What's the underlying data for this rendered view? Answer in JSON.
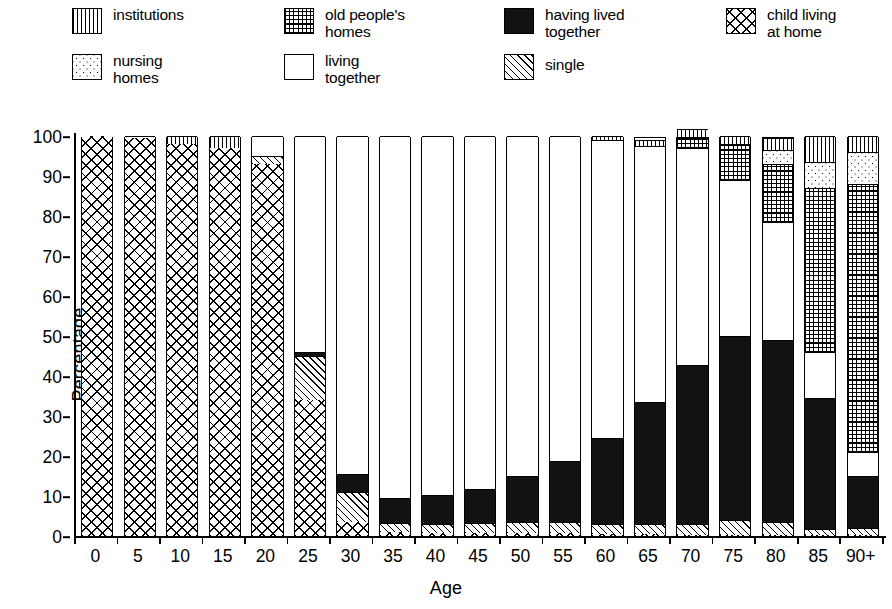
{
  "legend": {
    "items": [
      {
        "label": "institutions",
        "pattern": "institutions"
      },
      {
        "label": "old people's\nhomes",
        "pattern": "oldpeople"
      },
      {
        "label": "having lived\ntogether",
        "pattern": "havinglived"
      },
      {
        "label": "child living\nat home",
        "pattern": "childhome"
      },
      {
        "label": "nursing\nhomes",
        "pattern": "nursing"
      },
      {
        "label": "living\ntogether",
        "pattern": "livingtogether"
      },
      {
        "label": "single",
        "pattern": "single"
      }
    ]
  },
  "chart_data": {
    "type": "bar",
    "subtype": "stacked-bar-100",
    "title": "",
    "xlabel": "Age",
    "ylabel": "Percentage",
    "ylim": [
      0,
      100
    ],
    "ytick_labels": [
      "0",
      "10",
      "20",
      "30",
      "40",
      "50",
      "60",
      "70",
      "80",
      "90",
      "100"
    ],
    "ytick_values": [
      0,
      10,
      20,
      30,
      40,
      50,
      60,
      70,
      80,
      90,
      100
    ],
    "grid": false,
    "legend_position": "top",
    "categories": [
      "0",
      "5",
      "10",
      "15",
      "20",
      "25",
      "30",
      "35",
      "40",
      "45",
      "50",
      "55",
      "60",
      "65",
      "70",
      "75",
      "80",
      "85",
      "90+"
    ],
    "series": [
      {
        "name": "child living at home",
        "key": "childhome",
        "values": [
          100,
          99.5,
          98,
          97,
          93,
          34,
          3.5,
          1,
          0.8,
          0.8,
          0.8,
          0.8,
          0.5,
          0.5,
          0.3,
          0.3,
          0.3,
          0.2,
          0.2
        ]
      },
      {
        "name": "single",
        "key": "single",
        "values": [
          0,
          0,
          0,
          0,
          2,
          11,
          7.5,
          2.2,
          2.2,
          2.4,
          2.6,
          2.8,
          2.6,
          2.6,
          2.8,
          3.8,
          3.2,
          1.6,
          1.8
        ]
      },
      {
        "name": "having lived together",
        "key": "havinglived",
        "values": [
          0,
          0,
          0,
          0,
          0,
          1,
          4.5,
          6.3,
          7.3,
          8.5,
          11.6,
          15.2,
          21.4,
          30.4,
          39.7,
          45.9,
          45.5,
          32.7,
          13.0
        ]
      },
      {
        "name": "living together",
        "key": "livingtogether",
        "values": [
          0,
          0.5,
          0,
          0,
          5,
          54,
          84.5,
          90.5,
          89.7,
          88.3,
          85,
          81.2,
          74.5,
          64,
          54.2,
          39,
          29.5,
          11.5,
          6.0
        ]
      },
      {
        "name": "old people's homes",
        "key": "oldpeople",
        "values": [
          0,
          0,
          0,
          0,
          0,
          0,
          0,
          0,
          0,
          0,
          0,
          0,
          0,
          0,
          2.8,
          8.8,
          14.5,
          41.0,
          67.0
        ]
      },
      {
        "name": "nursing homes",
        "key": "nursing",
        "values": [
          0,
          0,
          0,
          0,
          0,
          0,
          0,
          0,
          0,
          0,
          0,
          0,
          0,
          0,
          0,
          0.2,
          3.5,
          6.5,
          8.0
        ]
      },
      {
        "name": "institutions",
        "key": "institutions",
        "values": [
          0,
          0,
          2,
          3,
          0,
          0,
          0,
          0,
          0,
          0,
          0,
          0,
          1.0,
          1.5,
          2.0,
          2.0,
          3.0,
          6.5,
          4.0
        ]
      }
    ],
    "stack_order_bottom_to_top": [
      "child living at home",
      "single",
      "having lived together",
      "living together",
      "old people's homes",
      "nursing homes",
      "institutions"
    ]
  }
}
